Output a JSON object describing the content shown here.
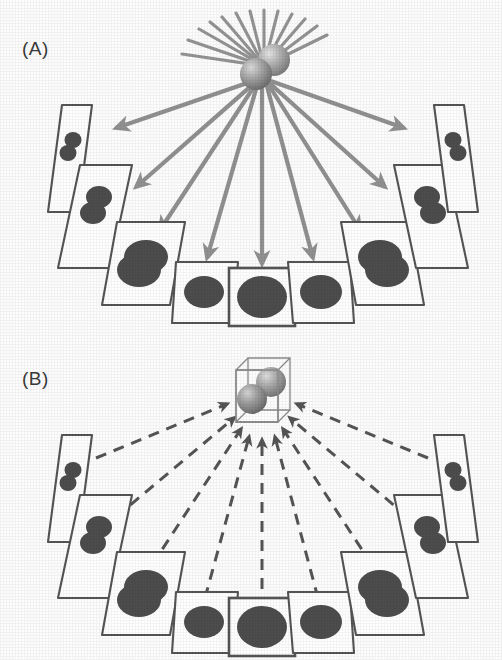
{
  "figure": {
    "kind": "scientific-diagram",
    "width": 502,
    "height": 660,
    "background": "#ffffff"
  },
  "colors": {
    "arrow_solid": "#8c8c8c",
    "arrow_dashed": "#555555",
    "panel_border": "#555555",
    "blob_fill": "#4d4d4d",
    "sphere_light": "#d8d8d8",
    "sphere_mid": "#9a9a9a",
    "sphere_dark": "#6f6f6f",
    "cube_wire": "#8a8a8a",
    "label_text": "#3a3a3a"
  },
  "panels": [
    {
      "id": "A",
      "label": "(A)",
      "label_text": "(A)",
      "arrow_style": "solid",
      "arrow_direction": "outward",
      "center_object": {
        "name": "two-sphere-object",
        "sphere_count": 2,
        "ray_count": 13,
        "boxed": false
      },
      "projection_count": 9
    },
    {
      "id": "B",
      "label": "(B)",
      "label_text": "(B)",
      "arrow_style": "dashed",
      "arrow_direction": "inward",
      "center_object": {
        "name": "reconstructed-volume",
        "sphere_count": 2,
        "ray_count": 0,
        "boxed": true
      },
      "projection_count": 9
    }
  ],
  "projections": [
    {
      "index": 0,
      "angle_deg": -72,
      "tilt": "extreme-left",
      "shear": -0.95,
      "scale_x": 0.18,
      "blobs": 2,
      "blob_layout": "stacked",
      "highlight": false
    },
    {
      "index": 1,
      "angle_deg": -54,
      "tilt": "far-left",
      "shear": -0.62,
      "scale_x": 0.38,
      "blobs": 2,
      "blob_layout": "stacked",
      "highlight": false
    },
    {
      "index": 2,
      "angle_deg": -36,
      "tilt": "left",
      "shear": -0.34,
      "scale_x": 0.66,
      "blobs": 1,
      "blob_layout": "merged",
      "highlight": false
    },
    {
      "index": 3,
      "angle_deg": -18,
      "tilt": "near-left",
      "shear": -0.15,
      "scale_x": 0.88,
      "blobs": 1,
      "blob_layout": "single",
      "highlight": false
    },
    {
      "index": 4,
      "angle_deg": 0,
      "tilt": "head-on",
      "shear": 0.0,
      "scale_x": 1.0,
      "blobs": 1,
      "blob_layout": "single",
      "highlight": true
    },
    {
      "index": 5,
      "angle_deg": 18,
      "tilt": "near-right",
      "shear": 0.15,
      "scale_x": 0.88,
      "blobs": 1,
      "blob_layout": "single",
      "highlight": false
    },
    {
      "index": 6,
      "angle_deg": 36,
      "tilt": "right",
      "shear": 0.34,
      "scale_x": 0.66,
      "blobs": 1,
      "blob_layout": "merged",
      "highlight": false
    },
    {
      "index": 7,
      "angle_deg": 54,
      "tilt": "far-right",
      "shear": 0.62,
      "scale_x": 0.38,
      "blobs": 2,
      "blob_layout": "stacked",
      "highlight": false
    },
    {
      "index": 8,
      "angle_deg": 72,
      "tilt": "extreme-right",
      "shear": 0.95,
      "scale_x": 0.18,
      "blobs": 2,
      "blob_layout": "stacked",
      "highlight": false
    }
  ]
}
